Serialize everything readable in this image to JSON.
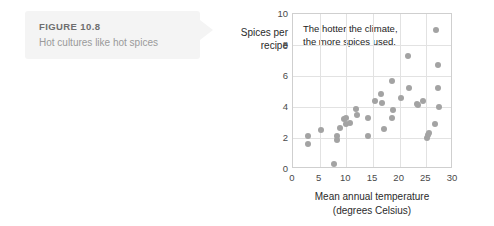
{
  "caption": {
    "figure_number": "FIGURE 10.8",
    "title": "Hot cultures like hot spices"
  },
  "chart_data": {
    "type": "scatter",
    "title": "",
    "annotation": "The hotter the climate,\nthe more spices used.",
    "xlabel": "Mean annual temperature\n(degrees Celsius)",
    "ylabel": "Spices per\nrecipe",
    "xlim": [
      0,
      30
    ],
    "ylim": [
      0,
      10
    ],
    "xticks": [
      0,
      5,
      10,
      15,
      20,
      25,
      30
    ],
    "yticks": [
      0,
      2,
      4,
      6,
      8,
      10
    ],
    "grid": true,
    "legend": "none",
    "marker_color": "#a3a3a3",
    "points": [
      [
        2.8,
        2.1
      ],
      [
        2.8,
        1.6
      ],
      [
        5.2,
        2.5
      ],
      [
        7.7,
        0.35
      ],
      [
        8.3,
        1.9
      ],
      [
        8.3,
        2.1
      ],
      [
        8.8,
        2.65
      ],
      [
        9.5,
        3.2
      ],
      [
        9.9,
        3.3
      ],
      [
        10.0,
        2.9
      ],
      [
        10.6,
        3.0
      ],
      [
        11.8,
        3.85
      ],
      [
        12.0,
        3.5
      ],
      [
        14.0,
        3.3
      ],
      [
        14.0,
        2.1
      ],
      [
        15.3,
        4.4
      ],
      [
        16.5,
        4.85
      ],
      [
        16.6,
        4.25
      ],
      [
        17.0,
        2.6
      ],
      [
        18.5,
        5.7
      ],
      [
        18.6,
        3.3
      ],
      [
        18.8,
        3.8
      ],
      [
        20.3,
        4.55
      ],
      [
        21.5,
        7.3
      ],
      [
        21.8,
        5.2
      ],
      [
        23.3,
        4.2
      ],
      [
        23.5,
        4.1
      ],
      [
        24.3,
        4.4
      ],
      [
        25.2,
        2.0
      ],
      [
        25.3,
        2.2
      ],
      [
        25.5,
        2.35
      ],
      [
        26.7,
        2.9
      ],
      [
        26.9,
        9.0
      ],
      [
        27.2,
        6.7
      ],
      [
        27.2,
        5.2
      ],
      [
        27.4,
        4.0
      ]
    ]
  }
}
